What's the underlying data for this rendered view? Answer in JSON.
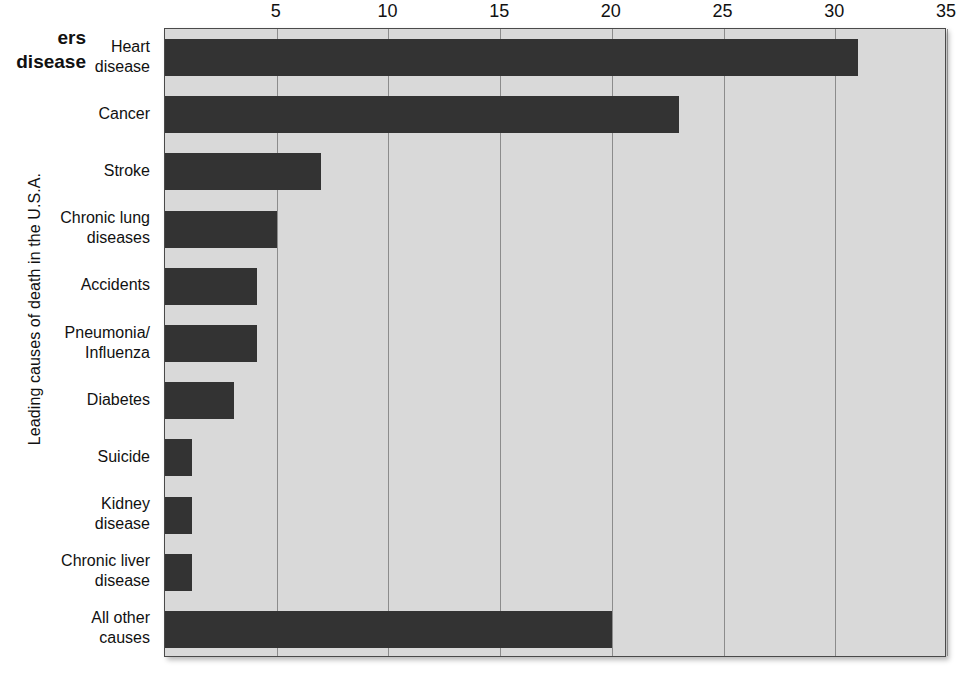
{
  "cropped_heading": "ers\ndisease",
  "axis": {
    "y_title": "Leading causes of death in the U.S.A.",
    "x_ticks": [
      "5",
      "10",
      "15",
      "20",
      "25",
      "30",
      "35"
    ]
  },
  "colors": {
    "bar": "#333333",
    "plot_background": "#d9d9d9",
    "gridline": "#8c8c8c",
    "frame": "#4a4a4a"
  },
  "chart_data": {
    "type": "bar",
    "orientation": "horizontal",
    "title": "",
    "xlabel": "",
    "ylabel": "Leading causes of death in the U.S.A.",
    "xlim": [
      0,
      35
    ],
    "xticks": [
      5,
      10,
      15,
      20,
      25,
      30,
      35
    ],
    "grid": true,
    "legend": false,
    "categories": [
      "Heart disease",
      "Cancer",
      "Stroke",
      "Chronic lung diseases",
      "Accidents",
      "Pneumonia/Influenza",
      "Diabetes",
      "Suicide",
      "Kidney disease",
      "Chronic liver disease",
      "All other causes"
    ],
    "values": [
      31,
      23,
      7,
      5,
      4.1,
      4.1,
      3.1,
      1.2,
      1.2,
      1.2,
      20
    ]
  },
  "category_labels": [
    "Heart\ndisease",
    "Cancer",
    "Stroke",
    "Chronic lung\ndiseases",
    "Accidents",
    "Pneumonia/\nInfluenza",
    "Diabetes",
    "Suicide",
    "Kidney\ndisease",
    "Chronic liver\ndisease",
    "All other\ncauses"
  ]
}
